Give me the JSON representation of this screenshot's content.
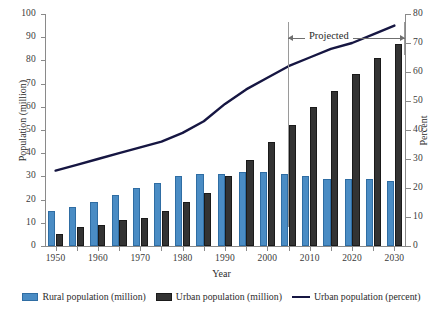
{
  "chart_data": {
    "type": "bar",
    "title": "",
    "xlabel": "Year",
    "ylabel": "Population (million)",
    "ylabel_secondary": "Percent",
    "categories": [
      "1950",
      "1955",
      "1960",
      "1965",
      "1970",
      "1975",
      "1980",
      "1985",
      "1990",
      "1995",
      "2000",
      "2005",
      "2010",
      "2015",
      "2020",
      "2025",
      "2030"
    ],
    "xtick_labels": [
      "1950",
      "1960",
      "1970",
      "1980",
      "1990",
      "2000",
      "2010",
      "2020",
      "2030"
    ],
    "ytick_labels": [
      "0",
      "10",
      "20",
      "30",
      "40",
      "50",
      "60",
      "70",
      "80",
      "90",
      "100"
    ],
    "ytick_labels_secondary": [
      "0",
      "10",
      "20",
      "30",
      "40",
      "50",
      "60",
      "70",
      "80"
    ],
    "ylim": [
      0,
      100
    ],
    "ylim_secondary": [
      0,
      80
    ],
    "grid": false,
    "legend_position": "bottom",
    "series": [
      {
        "name": "Rural population (million)",
        "type": "bar",
        "axis": "left",
        "color": "#4a8cc4",
        "values": [
          15,
          17,
          19,
          22,
          25,
          27,
          30,
          31,
          31,
          32,
          32,
          31,
          30,
          29,
          29,
          29,
          28
        ]
      },
      {
        "name": "Urban population (million)",
        "type": "bar",
        "axis": "left",
        "color": "#333333",
        "values": [
          5,
          8,
          9,
          11,
          12,
          15,
          19,
          23,
          30,
          37,
          45,
          52,
          60,
          67,
          74,
          81,
          87
        ]
      },
      {
        "name": "Urban population (percent)",
        "type": "line",
        "axis": "right",
        "color": "#161642",
        "values": [
          26,
          28,
          30,
          32,
          34,
          36,
          39,
          43,
          49,
          54,
          58,
          62,
          65,
          68,
          70,
          73,
          76
        ]
      }
    ],
    "annotations": [
      {
        "name": "projected-range",
        "label": "Projected",
        "from": "2005",
        "to": "2030"
      }
    ]
  },
  "legend": {
    "items": [
      {
        "label": "Rural population (million)",
        "swatch": "rural-swatch"
      },
      {
        "label": "Urban population (million)",
        "swatch": "urban-swatch"
      },
      {
        "label": "Urban population (percent)",
        "swatch": "line-swatch"
      }
    ]
  }
}
